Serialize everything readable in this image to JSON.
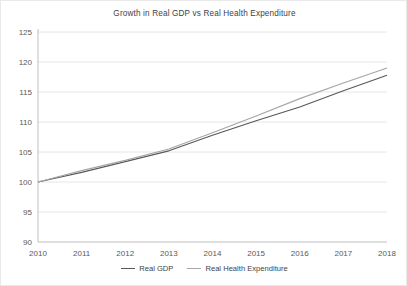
{
  "chart_data": {
    "type": "line",
    "title": "Growth in Real GDP vs Real Health Expenditure",
    "xlabel": "",
    "ylabel": "",
    "categories": [
      "2010",
      "2011",
      "2012",
      "2013",
      "2014",
      "2015",
      "2016",
      "2017",
      "2018"
    ],
    "x": [
      2010,
      2011,
      2012,
      2013,
      2014,
      2015,
      2016,
      2017,
      2018
    ],
    "ylim": [
      90,
      125
    ],
    "yticks": [
      90,
      95,
      100,
      105,
      110,
      115,
      120,
      125
    ],
    "ytick_labels": [
      "90",
      "95",
      "100",
      "105",
      "110",
      "115",
      "120",
      "125"
    ],
    "grid": true,
    "grid_axis": "y",
    "legend_position": "bottom",
    "series": [
      {
        "name": "Real GDP",
        "color": "#595959",
        "values": [
          100.0,
          101.6,
          103.4,
          105.2,
          107.8,
          110.2,
          112.5,
          115.2,
          117.8
        ]
      },
      {
        "name": "Real Health Expenditure",
        "color": "#a6a6a6",
        "values": [
          100.0,
          101.9,
          103.6,
          105.5,
          108.2,
          111.0,
          113.9,
          116.5,
          119.0
        ]
      }
    ]
  },
  "legend": {
    "items": [
      {
        "label": "Real GDP"
      },
      {
        "label": "Real Health Expenditure"
      }
    ]
  },
  "colors": {
    "gdp_line": "#595959",
    "health_line": "#a6a6a6",
    "grid": "#e6e6e6",
    "axis": "#bfbfbf",
    "text": "#3f3f3f",
    "frame": "#e9e9e9"
  }
}
